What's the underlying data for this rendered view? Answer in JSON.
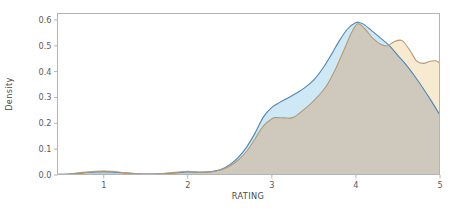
{
  "chart_data": {
    "type": "area",
    "title": "",
    "xlabel": "RATING",
    "ylabel": "Density",
    "xlim": [
      0.45,
      5.0
    ],
    "ylim": [
      0.0,
      0.625
    ],
    "grid": false,
    "legend": "none",
    "xticks": [
      1,
      2,
      3,
      4,
      5
    ],
    "xtick_labels": [
      "1",
      "2",
      "3",
      "4",
      "5"
    ],
    "yticks": [
      0.0,
      0.1,
      0.2,
      0.3,
      0.4,
      0.5,
      0.6
    ],
    "ytick_labels": [
      "0.0",
      "0.1",
      "0.2",
      "0.3",
      "0.4",
      "0.5",
      "0.6"
    ],
    "colors": {
      "series_blue_fill": "#cfe8f5",
      "series_blue_line": "#4a87b8",
      "series_orange_fill": "#f7ead0",
      "series_orange_line": "#b79a6d",
      "overlap_fill": "#cfc9bd",
      "spine": "#b4b4b4",
      "text": "#5b5b5b",
      "background": "#ffffff"
    },
    "series": [
      {
        "name": "series-blue",
        "fill": "#cfe8f5",
        "line": "#4a87b8",
        "x": [
          0.45,
          0.6,
          0.75,
          0.9,
          1.0,
          1.1,
          1.25,
          1.4,
          1.55,
          1.7,
          1.85,
          1.95,
          2.0,
          2.1,
          2.2,
          2.3,
          2.4,
          2.5,
          2.6,
          2.7,
          2.8,
          2.9,
          3.0,
          3.1,
          3.2,
          3.3,
          3.4,
          3.5,
          3.6,
          3.7,
          3.8,
          3.9,
          4.0,
          4.05,
          4.1,
          4.2,
          4.3,
          4.4,
          4.5,
          4.6,
          4.7,
          4.8,
          4.9,
          5.0
        ],
        "y": [
          0.002,
          0.004,
          0.008,
          0.012,
          0.013,
          0.012,
          0.008,
          0.005,
          0.004,
          0.005,
          0.008,
          0.011,
          0.012,
          0.011,
          0.011,
          0.014,
          0.022,
          0.04,
          0.068,
          0.108,
          0.162,
          0.225,
          0.262,
          0.282,
          0.3,
          0.318,
          0.34,
          0.368,
          0.41,
          0.462,
          0.518,
          0.565,
          0.59,
          0.589,
          0.582,
          0.555,
          0.528,
          0.5,
          0.462,
          0.425,
          0.382,
          0.335,
          0.285,
          0.232
        ]
      },
      {
        "name": "series-orange",
        "fill": "#f7ead0",
        "line": "#b79a6d",
        "x": [
          0.45,
          0.6,
          0.75,
          0.9,
          1.0,
          1.1,
          1.25,
          1.4,
          1.55,
          1.7,
          1.85,
          1.95,
          2.0,
          2.1,
          2.2,
          2.3,
          2.4,
          2.5,
          2.6,
          2.7,
          2.8,
          2.9,
          3.0,
          3.05,
          3.15,
          3.25,
          3.35,
          3.45,
          3.55,
          3.65,
          3.75,
          3.85,
          3.95,
          4.02,
          4.1,
          4.2,
          4.3,
          4.38,
          4.45,
          4.55,
          4.65,
          4.72,
          4.8,
          4.88,
          4.95,
          5.0
        ],
        "y": [
          0.002,
          0.005,
          0.01,
          0.014,
          0.015,
          0.014,
          0.009,
          0.005,
          0.004,
          0.006,
          0.01,
          0.013,
          0.014,
          0.012,
          0.011,
          0.013,
          0.02,
          0.035,
          0.058,
          0.092,
          0.14,
          0.19,
          0.218,
          0.222,
          0.221,
          0.222,
          0.245,
          0.272,
          0.305,
          0.345,
          0.405,
          0.478,
          0.552,
          0.585,
          0.568,
          0.53,
          0.505,
          0.5,
          0.515,
          0.52,
          0.478,
          0.442,
          0.432,
          0.44,
          0.442,
          0.432
        ]
      }
    ]
  },
  "axes": {
    "ylabel": "Density",
    "xlabel": "RATING"
  }
}
